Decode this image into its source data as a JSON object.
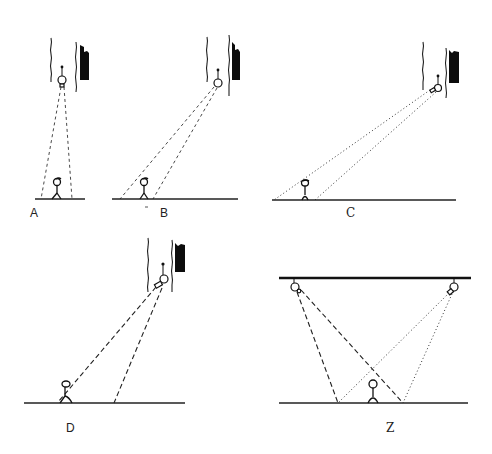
{
  "figure": {
    "panels": [
      {
        "id": "A",
        "label": "A",
        "camera_mount": "wall",
        "view": "steep downward",
        "line_style": "dashed"
      },
      {
        "id": "B",
        "label": "B",
        "camera_mount": "wall",
        "view": "angled",
        "line_style": "dashed"
      },
      {
        "id": "C",
        "label": "C",
        "camera_mount": "wall",
        "view": "shallow angled",
        "line_style": "dotted"
      },
      {
        "id": "D",
        "label": "D",
        "camera_mount": "wall",
        "view": "angled toward person",
        "line_style": "dashed"
      },
      {
        "id": "Z",
        "label": "Z",
        "camera_mount": "ceiling (two cameras)",
        "view": "crossing fields",
        "line_style": "dashed and dotted"
      }
    ]
  },
  "labels": {
    "A": "A",
    "B": "B",
    "C": "C",
    "D": "D",
    "Z": "Z"
  },
  "colors": {
    "background": "#ffffff",
    "ink": "#111111"
  }
}
